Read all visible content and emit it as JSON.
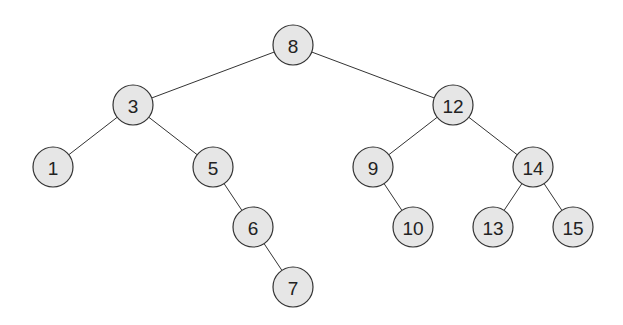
{
  "diagram": {
    "type": "binary-search-tree",
    "nodes": [
      {
        "id": "8",
        "label": "8",
        "x": 293,
        "y": 45
      },
      {
        "id": "3",
        "label": "3",
        "x": 133,
        "y": 105
      },
      {
        "id": "12",
        "label": "12",
        "x": 453,
        "y": 105
      },
      {
        "id": "1",
        "label": "1",
        "x": 53,
        "y": 167
      },
      {
        "id": "5",
        "label": "5",
        "x": 213,
        "y": 167
      },
      {
        "id": "9",
        "label": "9",
        "x": 373,
        "y": 167
      },
      {
        "id": "14",
        "label": "14",
        "x": 533,
        "y": 167
      },
      {
        "id": "6",
        "label": "6",
        "x": 253,
        "y": 227
      },
      {
        "id": "10",
        "label": "10",
        "x": 413,
        "y": 227
      },
      {
        "id": "13",
        "label": "13",
        "x": 493,
        "y": 227
      },
      {
        "id": "15",
        "label": "15",
        "x": 573,
        "y": 227
      },
      {
        "id": "7",
        "label": "7",
        "x": 293,
        "y": 287
      }
    ],
    "edges": [
      [
        "8",
        "3"
      ],
      [
        "8",
        "12"
      ],
      [
        "3",
        "1"
      ],
      [
        "3",
        "5"
      ],
      [
        "5",
        "6"
      ],
      [
        "6",
        "7"
      ],
      [
        "12",
        "9"
      ],
      [
        "12",
        "14"
      ],
      [
        "9",
        "10"
      ],
      [
        "14",
        "13"
      ],
      [
        "14",
        "15"
      ]
    ],
    "node_fill": "#e6e6e6",
    "node_stroke": "#333333"
  }
}
